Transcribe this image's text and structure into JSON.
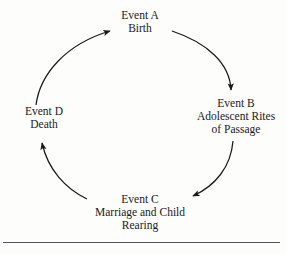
{
  "diagram": {
    "type": "cycle",
    "stroke_color": "#1a1a1a",
    "background_color": "#fdfdfc",
    "direction": "clockwise",
    "nodes": [
      {
        "id": "event-a",
        "position": "top",
        "lines": [
          "Event A",
          "Birth"
        ]
      },
      {
        "id": "event-b",
        "position": "right",
        "lines": [
          "Event B",
          "Adolescent Rites",
          "of Passage"
        ]
      },
      {
        "id": "event-c",
        "position": "bottom",
        "lines": [
          "Event C",
          "Marriage and Child",
          "Rearing"
        ]
      },
      {
        "id": "event-d",
        "position": "left",
        "lines": [
          "Event D",
          "Death"
        ]
      }
    ],
    "arrows": [
      {
        "from": "event-d",
        "to": "event-a",
        "name": "arrow-d-to-a"
      },
      {
        "from": "event-a",
        "to": "event-b",
        "name": "arrow-a-to-b"
      },
      {
        "from": "event-b",
        "to": "event-c",
        "name": "arrow-b-to-c"
      },
      {
        "from": "event-c",
        "to": "event-d",
        "name": "arrow-c-to-d"
      }
    ],
    "footer_rule": {
      "name": "footer-rule",
      "color": "#55555a"
    }
  }
}
